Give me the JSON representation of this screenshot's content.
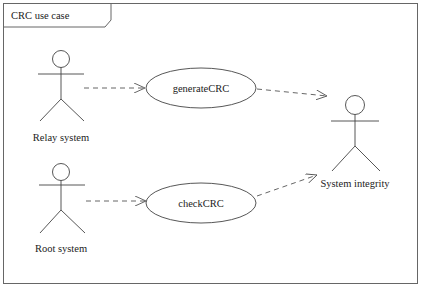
{
  "frame": {
    "title": "CRC use case"
  },
  "actors": [
    {
      "id": "relay",
      "label": "Relay system"
    },
    {
      "id": "root",
      "label": "Root system"
    },
    {
      "id": "integrity",
      "label": "System integrity"
    }
  ],
  "use_cases": [
    {
      "id": "generate",
      "label": "generateCRC"
    },
    {
      "id": "check",
      "label": "checkCRC"
    }
  ],
  "relations": [
    {
      "from": "relay",
      "to": "generate",
      "style": "dashed-arrow"
    },
    {
      "from": "root",
      "to": "check",
      "style": "dashed-arrow"
    },
    {
      "from": "generate",
      "to": "integrity",
      "style": "dashed-arrow"
    },
    {
      "from": "check",
      "to": "integrity",
      "style": "dashed-arrow"
    }
  ],
  "colors": {
    "line": "#444444",
    "frame": "#666666",
    "background": "#ffffff"
  }
}
